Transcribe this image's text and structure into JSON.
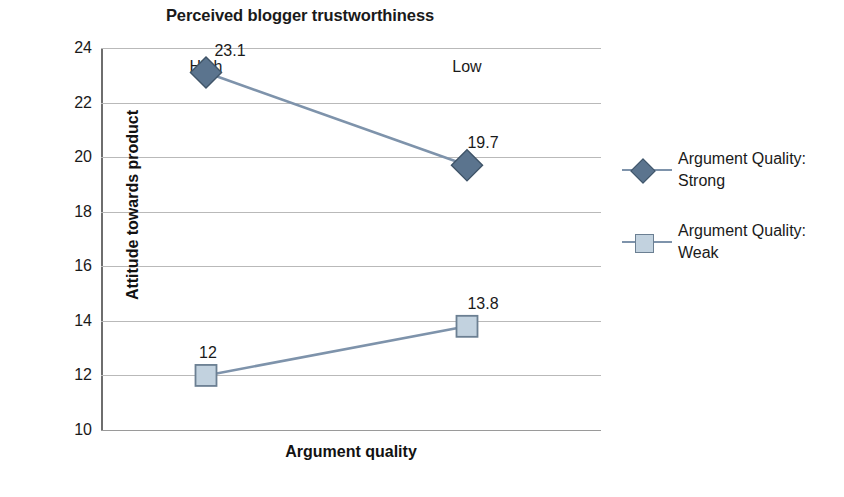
{
  "chart_data": {
    "type": "line",
    "title": "Perceived blogger trustworthiness",
    "xlabel": "Argument quality",
    "ylabel": "Attitude towards product",
    "categories": [
      "High",
      "Low"
    ],
    "ylim": [
      10,
      24
    ],
    "yticks": [
      10,
      12,
      14,
      16,
      18,
      20,
      22,
      24
    ],
    "ytick_labels": [
      "10",
      "12",
      "14",
      "16",
      "18",
      "20",
      "22",
      "24"
    ],
    "grid": true,
    "legend_position": "right",
    "series": [
      {
        "name": "Argument Quality: Strong",
        "marker": "diamond",
        "color": "#5b748e",
        "line_color": "#7e93ab",
        "values": [
          23.1,
          19.7
        ],
        "data_labels": [
          "23.1",
          "19.7"
        ]
      },
      {
        "name": "Argument Quality: Weak",
        "marker": "square",
        "color": "#c2d2df",
        "line_color": "#7e93ab",
        "values": [
          12,
          13.8
        ],
        "data_labels": [
          "12",
          "13.8"
        ]
      }
    ]
  },
  "legend": {
    "entries": [
      {
        "line1": "Argument Quality:",
        "line2": "Strong"
      },
      {
        "line1": "Argument Quality:",
        "line2": "Weak"
      }
    ]
  },
  "bottom_caption": {
    "text": ""
  },
  "colors": {
    "strong_marker": "#5b748e",
    "weak_marker": "#c2d2df",
    "series_line": "#7e93ab",
    "gridline": "#b9b9b9",
    "axis": "#6e6e6e",
    "text": "#1a1a1a"
  }
}
